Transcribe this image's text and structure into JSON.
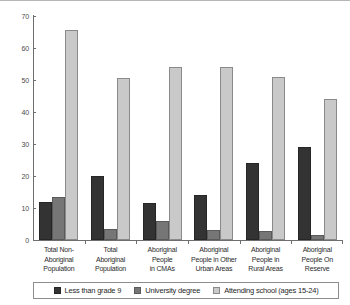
{
  "chart_data": {
    "type": "bar",
    "title": "",
    "subtitle": "",
    "xlabel": "",
    "ylabel": "",
    "ylim": [
      0,
      70
    ],
    "yticks": [
      0,
      10,
      20,
      30,
      40,
      50,
      60,
      70
    ],
    "grid": false,
    "legend_position": "bottom",
    "categories": [
      "Total Non-Aboriginal Population",
      "Total Aboriginal Population",
      "Aboriginal People in CMAs",
      "Aboriginal People in Other Urban Areas",
      "Aboriginal People in Rural Areas",
      "Aboriginal People On Reserve"
    ],
    "category_lines": [
      [
        "Total Non-",
        "Aboriginal",
        "Population"
      ],
      [
        "Total",
        "Aboriginal",
        "Population"
      ],
      [
        "Aboriginal",
        "People",
        "in CMAs"
      ],
      [
        "Aboriginal",
        "People in Other",
        "Urban Areas"
      ],
      [
        "Aboriginal",
        "People in",
        "Rural Areas"
      ],
      [
        "Aboriginal",
        "People On",
        "Reserve"
      ]
    ],
    "series": [
      {
        "name": "Less than grade 9",
        "color": "#333333",
        "values": [
          12,
          20,
          11.5,
          14,
          24,
          29
        ]
      },
      {
        "name": "University degree",
        "color": "#767676",
        "values": [
          13.5,
          3.5,
          5.8,
          3,
          2.8,
          1.5
        ]
      },
      {
        "name": "Attending school (ages 15-24)",
        "color": "#c9c9c9",
        "values": [
          65.5,
          50.5,
          54,
          54,
          51,
          44
        ]
      }
    ]
  }
}
